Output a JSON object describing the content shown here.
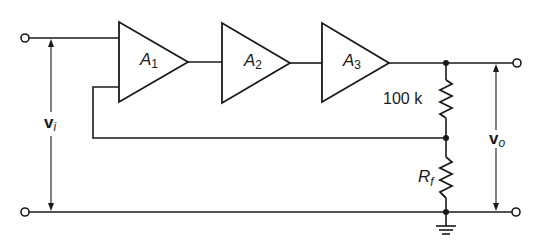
{
  "diagram": {
    "type": "circuit-schematic",
    "amplifiers": [
      {
        "id": "A1",
        "symbol": "A",
        "subscript": "1"
      },
      {
        "id": "A2",
        "symbol": "A",
        "subscript": "2"
      },
      {
        "id": "A3",
        "symbol": "A",
        "subscript": "3"
      }
    ],
    "resistors": [
      {
        "id": "upper",
        "label": "100 k"
      },
      {
        "id": "Rf",
        "symbol": "R",
        "subscript": "f"
      }
    ],
    "voltages": {
      "input": {
        "symbol": "v",
        "subscript": "i"
      },
      "output": {
        "symbol": "v",
        "subscript": "o"
      }
    },
    "ground": "ground-symbol",
    "colors": {
      "ink": "#1a1a1a",
      "background": "#ffffff"
    }
  }
}
